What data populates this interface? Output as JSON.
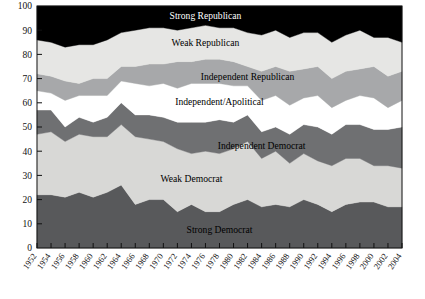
{
  "chart_data": {
    "type": "area",
    "title": "",
    "subtitle": "",
    "xlabel": "",
    "ylabel": "",
    "stacked": true,
    "grid": false,
    "legend_position": "inline-labels",
    "ylim": [
      0,
      100
    ],
    "yticks": [
      0,
      10,
      20,
      30,
      40,
      50,
      60,
      70,
      80,
      90,
      100
    ],
    "ytick_labels": [
      "0",
      "10",
      "20",
      "30",
      "40",
      "50",
      "60",
      "70",
      "80",
      "90",
      "100"
    ],
    "x": [
      1952,
      1954,
      1956,
      1958,
      1960,
      1962,
      1964,
      1966,
      1968,
      1970,
      1972,
      1974,
      1976,
      1978,
      1980,
      1982,
      1984,
      1986,
      1988,
      1990,
      1992,
      1994,
      1996,
      1998,
      2000,
      2002,
      2004
    ],
    "xtick_labels": [
      "1952",
      "1954",
      "1956",
      "1958",
      "1960",
      "1962",
      "1964",
      "1966",
      "1968",
      "1970",
      "1972",
      "1974",
      "1976",
      "1978",
      "1980",
      "1982",
      "1984",
      "1986",
      "1988",
      "1990",
      "1992",
      "1994",
      "1996",
      "1998",
      "2000",
      "2002",
      "2004"
    ],
    "series": [
      {
        "name": "Strong Democrat",
        "color": "#58595b",
        "label_color": "#000000",
        "values": [
          22,
          22,
          21,
          23,
          21,
          23,
          26,
          18,
          20,
          20,
          15,
          18,
          15,
          15,
          18,
          20,
          17,
          18,
          17,
          20,
          18,
          15,
          18,
          19,
          19,
          17,
          17
        ]
      },
      {
        "name": "Weak Democrat",
        "color": "#d8d8d6",
        "label_color": "#000000",
        "values": [
          25,
          26,
          23,
          24,
          25,
          23,
          25,
          28,
          25,
          24,
          26,
          21,
          25,
          24,
          23,
          24,
          20,
          22,
          18,
          19,
          18,
          19,
          19,
          18,
          15,
          17,
          16
        ]
      },
      {
        "name": "Independent Democrat",
        "color": "#6f7072",
        "label_color": "#000000",
        "values": [
          10,
          9,
          6,
          7,
          6,
          8,
          9,
          9,
          10,
          10,
          11,
          13,
          12,
          14,
          11,
          11,
          11,
          10,
          12,
          12,
          14,
          13,
          14,
          14,
          15,
          15,
          17
        ]
      },
      {
        "name": "Independent/Apolitical",
        "color": "#ffffff",
        "label_color": "#000000",
        "values": [
          8,
          7,
          11,
          9,
          11,
          9,
          9,
          13,
          12,
          14,
          14,
          16,
          16,
          15,
          15,
          12,
          13,
          13,
          12,
          11,
          13,
          11,
          10,
          12,
          13,
          9,
          11
        ]
      },
      {
        "name": "Independent Republican",
        "color": "#a7a8aa",
        "label_color": "#000000",
        "values": [
          7,
          7,
          8,
          5,
          7,
          7,
          6,
          7,
          9,
          8,
          11,
          9,
          10,
          10,
          10,
          8,
          12,
          12,
          14,
          12,
          12,
          12,
          12,
          11,
          13,
          13,
          12
        ]
      },
      {
        "name": "Weak Republican",
        "color": "#e6e6e4",
        "label_color": "#000000",
        "values": [
          14,
          14,
          14,
          16,
          14,
          16,
          14,
          15,
          15,
          15,
          13,
          14,
          14,
          13,
          14,
          14,
          15,
          15,
          14,
          15,
          14,
          15,
          15,
          16,
          12,
          16,
          12
        ]
      },
      {
        "name": "Strong Republican",
        "color": "#000000",
        "label_color": "#ffffff",
        "values": [
          14,
          15,
          17,
          16,
          16,
          14,
          11,
          10,
          9,
          9,
          10,
          9,
          8,
          9,
          9,
          11,
          12,
          10,
          13,
          11,
          11,
          15,
          12,
          10,
          13,
          13,
          15
        ]
      }
    ]
  },
  "axes": {
    "y_axis_name": "percent-axis",
    "x_axis_name": "year-axis"
  }
}
